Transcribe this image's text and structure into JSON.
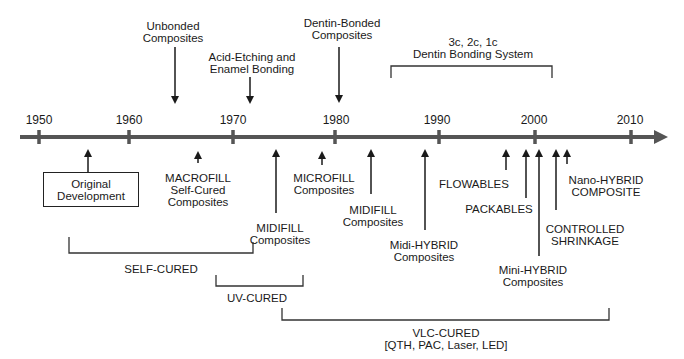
{
  "diagram": {
    "type": "timeline",
    "axis": {
      "years": [
        "1950",
        "1960",
        "1970",
        "1980",
        "1990",
        "2000",
        "2010"
      ]
    },
    "above_events": [
      {
        "label_line1": "Unbonded",
        "label_line2": "Composites"
      },
      {
        "label_line1": "Acid-Etching and",
        "label_line2": "Enamel Bonding"
      },
      {
        "label_line1": "Dentin-Bonded",
        "label_line2": "Composites"
      }
    ],
    "above_bracket": {
      "label_line1": "3c, 2c, 1c",
      "label_line2": "Dentin Bonding System"
    },
    "below_events": {
      "original": {
        "label_line1": "Original",
        "label_line2": "Development"
      },
      "macrofill": {
        "label_line1": "MACROFILL",
        "label_line2": "Self-Cured",
        "label_line3": "Composites"
      },
      "midifill_1": {
        "label_line1": "MIDIFILL",
        "label_line2": "Composites"
      },
      "microfill": {
        "label_line1": "MICROFILL",
        "label_line2": "Composites"
      },
      "midifill_2": {
        "label_line1": "MIDIFILL",
        "label_line2": "Composites"
      },
      "midi_hybrid": {
        "label_line1": "Midi-HYBRID",
        "label_line2": "Composites"
      },
      "flowables": {
        "label": "FLOWABLES"
      },
      "packables": {
        "label": "PACKABLES"
      },
      "mini_hybrid": {
        "label_line1": "Mini-HYBRID",
        "label_line2": "Composites"
      },
      "controlled_shrinkage": {
        "label_line1": "CONTROLLED",
        "label_line2": "SHRINKAGE"
      },
      "nano_hybrid": {
        "label_line1": "Nano-HYBRID",
        "label_line2": "COMPOSITE"
      }
    },
    "curing_brackets": {
      "self_cured": {
        "label": "SELF-CURED"
      },
      "uv_cured": {
        "label": "UV-CURED"
      },
      "vlc_cured": {
        "label_line1": "VLC-CURED",
        "label_line2": "[QTH, PAC, Laser, LED]"
      }
    },
    "colors": {
      "axis": "#555555",
      "ink": "#1a1a1a",
      "background": "#ffffff"
    }
  }
}
